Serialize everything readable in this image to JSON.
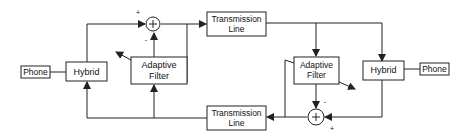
{
  "diagram": {
    "nodes": {
      "phone_left": {
        "label": "Phone"
      },
      "hybrid_left": {
        "label": "Hybrid"
      },
      "sum_top": {
        "label": "+",
        "plus_sign": "+",
        "minus_sign": "-"
      },
      "tline_top": {
        "line1": "Transmission",
        "line2": "Line"
      },
      "afilter_left": {
        "line1": "Adaptive",
        "line2": "Filter"
      },
      "tline_bottom": {
        "line1": "Transmission",
        "line2": "Line"
      },
      "afilter_right": {
        "line1": "Adaptive",
        "line2": "Filter"
      },
      "hybrid_right": {
        "label": "Hybrid"
      },
      "phone_right": {
        "label": "Phone"
      },
      "sum_bottom": {
        "label": "+",
        "plus_sign": "+",
        "minus_sign": "-"
      }
    },
    "edges": [
      {
        "from": "phone_left",
        "to": "hybrid_left"
      },
      {
        "from": "hybrid_left",
        "to": "sum_top",
        "sign": "+"
      },
      {
        "from": "afilter_left",
        "to": "sum_top",
        "sign": "-"
      },
      {
        "from": "sum_top",
        "to": "tline_top"
      },
      {
        "from": "sum_top",
        "to": "afilter_left",
        "type": "error-feedback"
      },
      {
        "from": "tline_top",
        "to": "afilter_right"
      },
      {
        "from": "tline_top",
        "to": "hybrid_right"
      },
      {
        "from": "hybrid_right",
        "to": "phone_right"
      },
      {
        "from": "hybrid_right",
        "to": "sum_bottom",
        "sign": "+"
      },
      {
        "from": "afilter_right",
        "to": "sum_bottom",
        "sign": "-"
      },
      {
        "from": "sum_bottom",
        "to": "tline_bottom"
      },
      {
        "from": "sum_bottom",
        "to": "afilter_right",
        "type": "error-feedback"
      },
      {
        "from": "tline_bottom",
        "to": "afilter_left"
      },
      {
        "from": "tline_bottom",
        "to": "hybrid_left"
      }
    ],
    "colors": {
      "stroke": "#222222",
      "background": "#ffffff"
    }
  }
}
